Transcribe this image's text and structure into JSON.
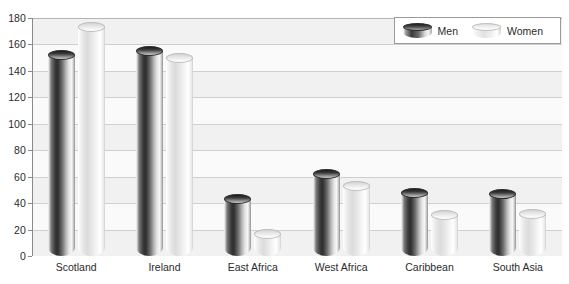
{
  "chart_data": {
    "type": "bar",
    "title": "",
    "subtitle": "",
    "xlabel": "",
    "ylabel": "",
    "categories": [
      "Scotland",
      "Ireland",
      "East Africa",
      "West Africa",
      "Caribbean",
      "South Asia"
    ],
    "series": [
      {
        "name": "Men",
        "values": [
          152,
          155,
          43,
          62,
          48,
          47
        ]
      },
      {
        "name": "Women",
        "values": [
          173,
          150,
          17,
          53,
          31,
          32
        ]
      }
    ],
    "ylim": [
      0,
      180
    ],
    "y_ticks": [
      0,
      20,
      40,
      60,
      80,
      100,
      120,
      140,
      160,
      180
    ],
    "y_tick_labels": [
      "0",
      "20",
      "40",
      "60",
      "80",
      "100",
      "120",
      "140",
      "160",
      "180"
    ],
    "grid": true,
    "grid_orientation": "horizontal",
    "legend_position": "top-right",
    "legend_entries": [
      "Men",
      "Women"
    ],
    "annotations": [],
    "style": "3d-cylinder-grouped"
  },
  "legend": {
    "items": [
      {
        "label": "Men",
        "swatch": "cylinder-dark-icon"
      },
      {
        "label": "Women",
        "swatch": "cylinder-light-icon"
      }
    ]
  },
  "colors": {
    "men_dark": "#2e2e2e",
    "men_highlight": "#f7f7f7",
    "women_light": "#e4e4e4",
    "women_highlight": "#ffffff",
    "gridline": "#cfcfcf",
    "axis": "#8a8a8a",
    "plot_background": "#fafafa",
    "plot_band": "#f1f1f1",
    "text": "#2b2b2b",
    "page_background": "#ffffff",
    "legend_border": "#9a9a9a"
  }
}
